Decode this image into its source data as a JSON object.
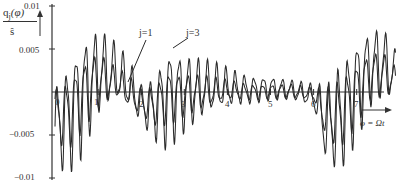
{
  "chart_data": {
    "type": "line",
    "title": "",
    "ylabel": "q_j(φ) / ŝ",
    "xlabel": "φ = Ωt",
    "ylim": [
      -0.01,
      0.01
    ],
    "xlim": [
      0,
      8
    ],
    "yticks": [
      "0.01",
      "0.005",
      "−0.005",
      "−0.01"
    ],
    "ytick_values": [
      0.01,
      0.005,
      -0.005,
      -0.01
    ],
    "xticks": [
      "0",
      "1",
      "2",
      "3",
      "4",
      "5",
      "6",
      "7"
    ],
    "grid": false,
    "legend": "inline annotations",
    "annotations": [
      "j=1",
      "j=3"
    ],
    "series": [
      {
        "name": "j=1",
        "description": "larger-amplitude oscillation",
        "envelope": {
          "x": [
            0,
            0.3,
            0.6,
            1.0,
            1.4,
            1.7,
            2.0,
            2.3,
            2.6,
            3.0,
            3.5,
            4.0,
            4.5,
            5.0,
            5.5,
            6.0,
            6.3,
            6.6,
            7.0,
            7.3,
            7.6,
            7.9
          ],
          "upper": [
            0.001,
            0.004,
            0.007,
            0.008,
            0.006,
            0.004,
            0.001,
            0.002,
            0.006,
            0.005,
            0.004,
            0.003,
            0.002,
            0.002,
            0.0015,
            0.001,
            0.001,
            0.004,
            0.007,
            0.008,
            0.008,
            0.005
          ],
          "lower": [
            -0.009,
            -0.01,
            -0.008,
            -0.003,
            -0.001,
            -0.002,
            -0.004,
            -0.006,
            -0.007,
            -0.005,
            -0.003,
            -0.002,
            -0.0015,
            -0.001,
            -0.001,
            -0.002,
            -0.009,
            -0.01,
            -0.006,
            -0.002,
            -0.001,
            -0.001
          ]
        }
      },
      {
        "name": "j=3",
        "description": "smaller-amplitude oscillation",
        "envelope": {
          "x": [
            0,
            0.3,
            0.6,
            1.0,
            1.4,
            1.7,
            2.0,
            2.3,
            2.6,
            3.0,
            3.5,
            4.0,
            4.5,
            5.0,
            5.5,
            6.0,
            6.3,
            6.6,
            7.0,
            7.3,
            7.6,
            7.9
          ],
          "upper": [
            0.0005,
            0.002,
            0.004,
            0.005,
            0.003,
            0.002,
            0.0005,
            0.001,
            0.003,
            0.0025,
            0.002,
            0.0015,
            0.001,
            0.001,
            0.001,
            0.0005,
            0.0005,
            0.002,
            0.004,
            0.005,
            0.005,
            0.003
          ],
          "lower": [
            -0.006,
            -0.007,
            -0.005,
            -0.002,
            -0.0008,
            -0.002,
            -0.003,
            -0.004,
            -0.004,
            -0.003,
            -0.002,
            -0.001,
            -0.001,
            -0.0008,
            -0.0008,
            -0.001,
            -0.006,
            -0.007,
            -0.004,
            -0.001,
            -0.0008,
            -0.0005
          ]
        }
      }
    ]
  },
  "labels": {
    "ylabel_top": "q",
    "ylabel_sub": "j",
    "ylabel_arg": "(φ)",
    "ylabel_den": "ŝ",
    "xlabel": "φ = Ωt",
    "j1": "j=1",
    "j3": "j=3"
  },
  "colors": {
    "line": "#2a2a2a",
    "axis": "#333333"
  }
}
